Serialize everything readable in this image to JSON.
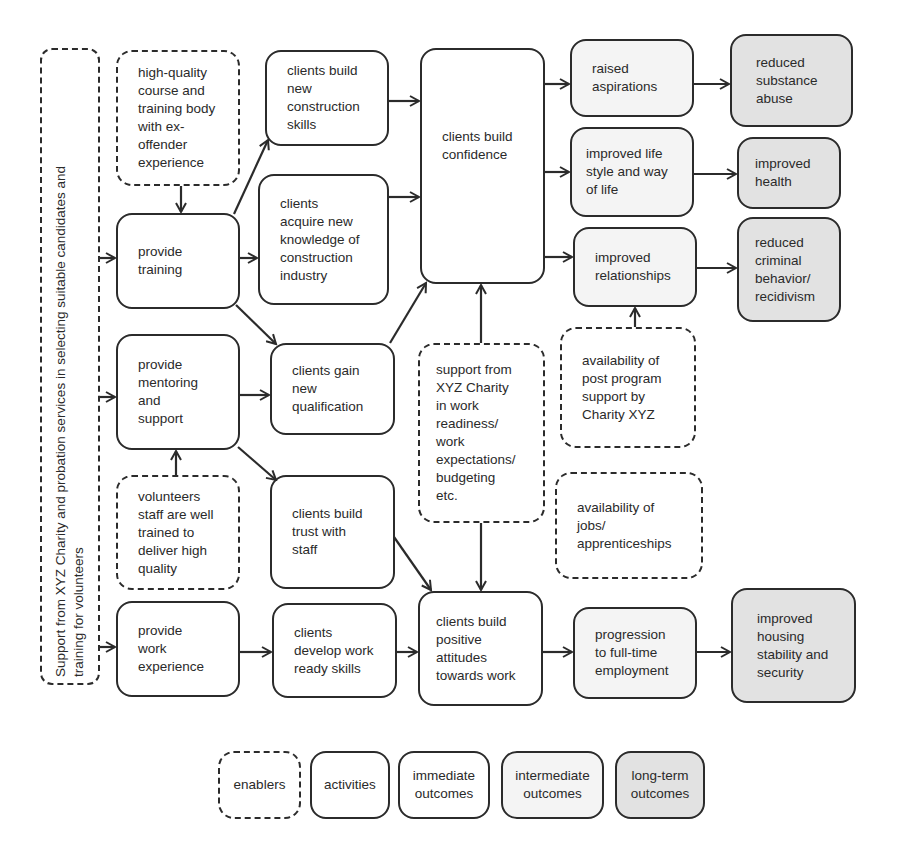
{
  "diagram": {
    "type": "logic-model",
    "enablers_sidebar": "Support from XYZ Charity and probation services in selecting suitable candidates and\ntraining for volunteers",
    "enablers": {
      "high_quality": "high-quality\ncourse and\ntraining body\nwith ex-\noffender\nexperience",
      "volunteers": "volunteers\nstaff are well\ntrained to\ndeliver high\nquality",
      "support_xyz": "support from\nXYZ Charity\nin work\nreadiness/\nwork\nexpectations/\nbudgeting\netc.",
      "post_program": "availability of\npost program\nsupport by\nCharity XYZ",
      "jobs": "availability of\njobs/\napprenticeships"
    },
    "activities": {
      "training": "provide\ntraining",
      "mentoring": "provide\nmentoring\nand\nsupport",
      "work_experience": "provide\nwork\nexperience"
    },
    "immediate_outcomes": {
      "construction_skills": "clients build\nnew\nconstruction\nskills",
      "knowledge": "clients\nacquire new\nknowledge of\nconstruction\nindustry",
      "qualification": "clients gain\nnew\nqualification",
      "trust": "clients build\ntrust with\nstaff",
      "work_ready": "clients\ndevelop work\nready skills",
      "confidence": "clients build\nconfidence",
      "positive_attitudes": "clients build\npositive\nattitudes\ntowards work"
    },
    "intermediate_outcomes": {
      "aspirations": "raised\naspirations",
      "lifestyle": "improved life\nstyle and way\nof life",
      "relationships": "improved\nrelationships",
      "employment": "progression\nto full-time\nemployment"
    },
    "longterm_outcomes": {
      "substance": "reduced\nsubstance\nabuse",
      "health": "improved\nhealth",
      "criminal": "reduced\ncriminal\nbehavior/\nrecidivism",
      "housing": "improved\nhousing\nstability and\nsecurity"
    },
    "legend": {
      "enablers": "enablers",
      "activities": "activities",
      "immediate": "immediate\noutcomes",
      "intermediate": "intermediate\noutcomes",
      "longterm": "long-term\noutcomes"
    },
    "colors": {
      "stroke": "#2b2b2b",
      "intermediate_fill": "#f4f4f4",
      "longterm_fill": "#e2e2e2"
    }
  }
}
